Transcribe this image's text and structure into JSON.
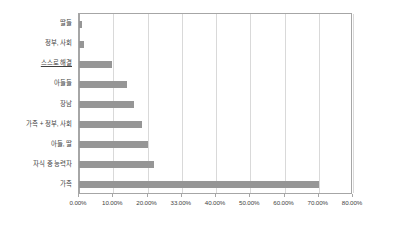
{
  "chart_data": {
    "type": "bar",
    "orientation": "horizontal",
    "title": "",
    "xlabel": "",
    "ylabel": "",
    "categories": [
      "딸들",
      "정부, 사회",
      "스스로 해결",
      "아들들",
      "장남",
      "가족 + 정부, 사회",
      "아들, 딸",
      "자식 중 능력자",
      "가족"
    ],
    "values": [
      1.0,
      1.5,
      9.5,
      14.0,
      16.0,
      18.5,
      20.0,
      22.0,
      70.0
    ],
    "value_unit": "%",
    "xlim": [
      0,
      80
    ],
    "x_tick_values": [
      0,
      10,
      20,
      30,
      40,
      50,
      60,
      70,
      80
    ],
    "x_tick_labels": [
      "0.00%",
      "10.00%",
      "20.00%",
      "33.00%",
      "40.00%",
      "50.00%",
      "60.00%",
      "70.00%",
      "80.00%"
    ],
    "grid": true,
    "grid_axis": "x",
    "legend": false,
    "bar_color": "#969696",
    "grid_color": "#d9d9d9",
    "axis_color": "#a6a6a6",
    "text_color": "#3f3f3f",
    "underlined_categories": [
      "스스로 해결"
    ]
  }
}
